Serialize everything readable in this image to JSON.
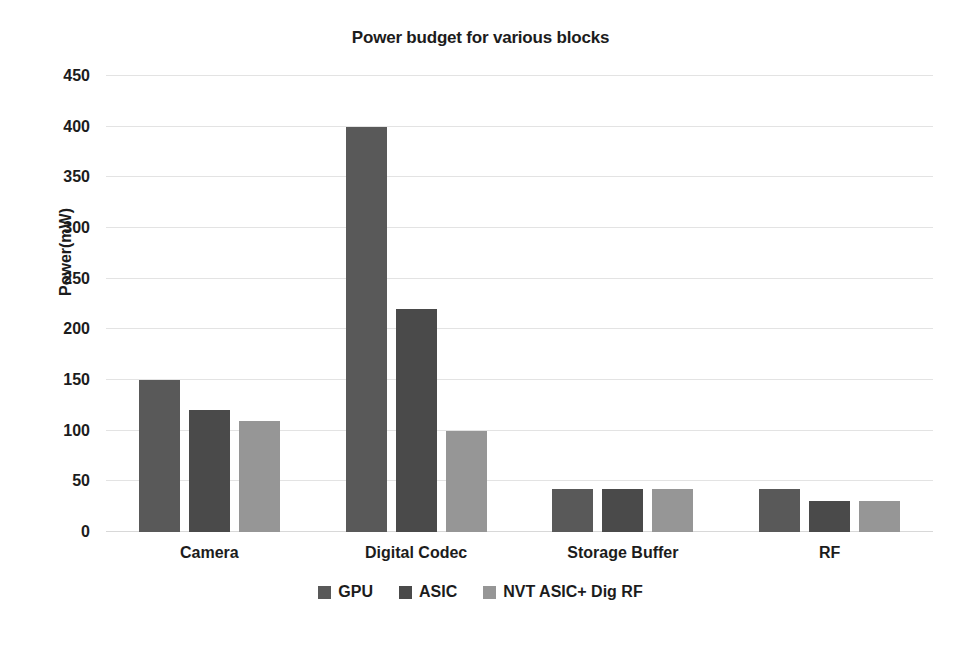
{
  "chart_data": {
    "type": "bar",
    "title": "Power budget for various blocks",
    "xlabel": "",
    "ylabel": "Power(mW)",
    "ylim": [
      0,
      450
    ],
    "ytick_step": 50,
    "yticks": [
      450,
      400,
      350,
      300,
      250,
      200,
      150,
      100,
      50,
      0
    ],
    "ytick_labels": [
      "450",
      "400",
      "350",
      "300",
      "250",
      "200",
      "150",
      "100",
      "50",
      "0"
    ],
    "grid": true,
    "grid_axis": "y",
    "legend_position": "bottom",
    "categories": [
      "Camera",
      "Digital Codec",
      "Storage Buffer",
      "RF"
    ],
    "series": [
      {
        "name": "GPU",
        "color": "#595959",
        "values": [
          150,
          400,
          42,
          42
        ]
      },
      {
        "name": "ASIC",
        "color": "#4a4a4a",
        "values": [
          120,
          220,
          42,
          31
        ]
      },
      {
        "name": "NVT ASIC+ Dig RF",
        "color": "#969696",
        "values": [
          110,
          100,
          42,
          31
        ]
      }
    ]
  },
  "colors": {
    "background": "#ffffff",
    "text": "#1c1c1c",
    "gridline": "#e3e3e3",
    "series_gpu": "#595959",
    "series_asic": "#4a4a4a",
    "series_nvt": "#969696"
  }
}
